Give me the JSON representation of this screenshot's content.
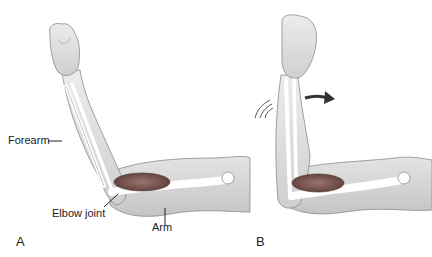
{
  "figure": {
    "panels": [
      {
        "id": "A",
        "label": "A",
        "state": "elbow flexed"
      },
      {
        "id": "B",
        "label": "B",
        "state": "elbow extending with motion"
      }
    ],
    "labels": {
      "forearm": "Forearm",
      "elbow_joint": "Elbow joint",
      "arm": "Arm"
    },
    "icons": {
      "motion_arrow": "arrow-right-curved-icon",
      "motion_lines": "motion-lines-icon"
    },
    "colors": {
      "skin": "#e6e6e6",
      "skin_shadow": "#c9c9c9",
      "outline": "#8a8a8a",
      "bone": "#ffffff",
      "muscle": "#6e4a46",
      "muscle_light": "#9a7570",
      "text": "#222222",
      "arrow": "#333333"
    }
  }
}
